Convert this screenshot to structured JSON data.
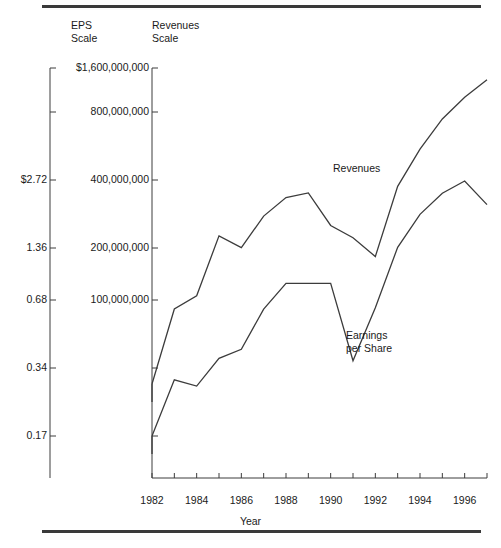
{
  "rules": {
    "top": "",
    "bottom": ""
  },
  "axis_headers": {
    "eps": "EPS\nScale",
    "revenues": "Revenues\nScale"
  },
  "axis_titles": {
    "x": "Year"
  },
  "series_labels": {
    "revenues": "Revenues",
    "eps": "Earnings\nper Share"
  },
  "eps_ticks": [
    {
      "label": "",
      "value": 5.44,
      "y": 112
    },
    {
      "label": "$2.72",
      "value": 2.72,
      "y": 180
    },
    {
      "label": "1.36",
      "value": 1.36,
      "y": 248
    },
    {
      "label": "0.68",
      "value": 0.68,
      "y": 300
    },
    {
      "label": "0.34",
      "value": 0.34,
      "y": 368
    },
    {
      "label": "0.17",
      "value": 0.17,
      "y": 436
    }
  ],
  "revenue_ticks": [
    {
      "label": "$1,600,000,000",
      "value": 1600000000,
      "y": 68
    },
    {
      "label": "800,000,000",
      "value": 800000000,
      "y": 112
    },
    {
      "label": "400,000,000",
      "value": 400000000,
      "y": 180
    },
    {
      "label": "200,000,000",
      "value": 200000000,
      "y": 248
    },
    {
      "label": "100,000,000",
      "value": 100000000,
      "y": 300
    },
    {
      "label": "",
      "value": 50000000,
      "y": 368
    },
    {
      "label": "",
      "value": 25000000,
      "y": 436
    }
  ],
  "x_tick_labels": [
    "1982",
    "1984",
    "1986",
    "1988",
    "1990",
    "1992",
    "1994",
    "1996"
  ],
  "chart_data": {
    "type": "line",
    "title": "",
    "xlabel": "Year",
    "ylabel": "",
    "grid": false,
    "legend": "inline-annotations",
    "yscale": "log",
    "xlim": [
      1982,
      1997
    ],
    "axes": [
      {
        "name": "EPS Scale",
        "side": "left-outer",
        "scale": "log",
        "unit": "dollars per share",
        "ticks": [
          5.44,
          2.72,
          1.36,
          0.68,
          0.34,
          0.17
        ],
        "tick_labels": [
          "",
          "$2.72",
          "1.36",
          "0.68",
          "0.34",
          "0.17"
        ]
      },
      {
        "name": "Revenues Scale",
        "side": "left-inner",
        "scale": "log",
        "unit": "dollars",
        "ticks": [
          1600000000,
          800000000,
          400000000,
          200000000,
          100000000,
          50000000,
          25000000
        ],
        "tick_labels": [
          "$1,600,000,000",
          "800,000,000",
          "400,000,000",
          "200,000,000",
          "100,000,000",
          "",
          ""
        ]
      }
    ],
    "x": [
      1982,
      1983,
      1984,
      1985,
      1986,
      1987,
      1988,
      1989,
      1990,
      1991,
      1992,
      1993,
      1994,
      1995,
      1996,
      1997
    ],
    "series": [
      {
        "name": "Revenues",
        "axis": "Revenues Scale",
        "values": [
          45000000,
          105000000,
          122000000,
          240000000,
          210000000,
          300000000,
          370000000,
          390000000,
          270000000,
          235000000,
          190000000,
          420000000,
          640000000,
          900000000,
          1150000000,
          1400000000
        ]
      },
      {
        "name": "Earnings per Share",
        "axis": "EPS Scale",
        "values": [
          0.17,
          0.31,
          0.29,
          0.39,
          0.43,
          0.66,
          0.87,
          0.87,
          0.87,
          0.38,
          0.67,
          1.28,
          1.82,
          2.28,
          2.6,
          2.02
        ]
      }
    ]
  },
  "geometry": {
    "plot_left": 152,
    "plot_right": 487,
    "eps_axis_x": 50,
    "axis_top": 68,
    "axis_bottom": 478,
    "x_axis_y": 478
  }
}
